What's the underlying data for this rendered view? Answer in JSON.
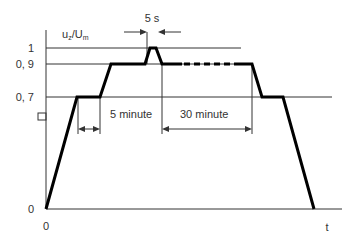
{
  "diagram": {
    "y_axis_label_main": "u",
    "y_axis_label_sub1": "z",
    "y_axis_label_mid": "/U",
    "y_axis_label_sub2": "m",
    "x_axis_label": "t",
    "y_ticks": [
      {
        "label": "1",
        "value": 1.0
      },
      {
        "label": "0, 9",
        "value": 0.9
      },
      {
        "label": "0, 7",
        "value": 0.7
      },
      {
        "label": "0",
        "value": 0
      }
    ],
    "x_origin_label": "0",
    "annotations": {
      "pulse_duration": "5 s",
      "first_hold": "5 minute",
      "second_hold": "30 minute"
    },
    "profile_levels": [
      0,
      0.7,
      0.9,
      1.0,
      0.9,
      0.7,
      0
    ]
  }
}
